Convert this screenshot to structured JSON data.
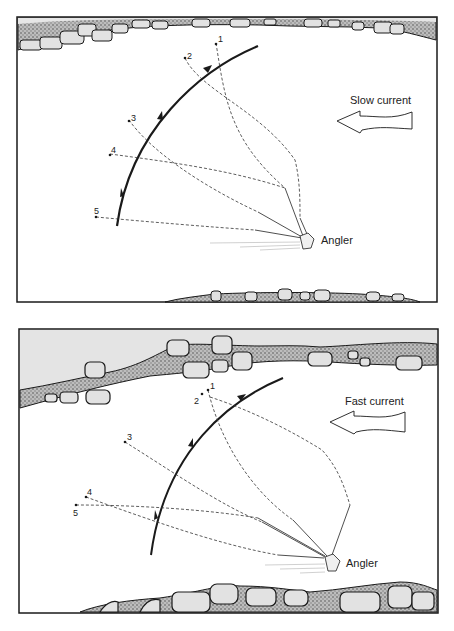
{
  "panels": [
    {
      "id": "slow",
      "current_label": "Slow current",
      "angler_label": "Angler",
      "points": [
        {
          "label": "1",
          "x": 216,
          "y": 43
        },
        {
          "label": "2",
          "x": 185,
          "y": 58
        },
        {
          "label": "3",
          "x": 129,
          "y": 120
        },
        {
          "label": "4",
          "x": 110,
          "y": 154
        },
        {
          "label": "5",
          "x": 96,
          "y": 217
        }
      ]
    },
    {
      "id": "fast",
      "current_label": "Fast current",
      "angler_label": "Angler",
      "points": [
        {
          "label": "1",
          "x": 208,
          "y": 387
        },
        {
          "label": "2",
          "x": 202,
          "y": 394
        },
        {
          "label": "3",
          "x": 125,
          "y": 442
        },
        {
          "label": "4",
          "x": 86,
          "y": 497
        },
        {
          "label": "5",
          "x": 76,
          "y": 505
        }
      ]
    }
  ],
  "colors": {
    "ink": "#1a1a1a",
    "sky": "#e4e4e4",
    "rock": "#dcdcdc",
    "gravel": "#8a8a8a",
    "water": "#ffffff"
  }
}
